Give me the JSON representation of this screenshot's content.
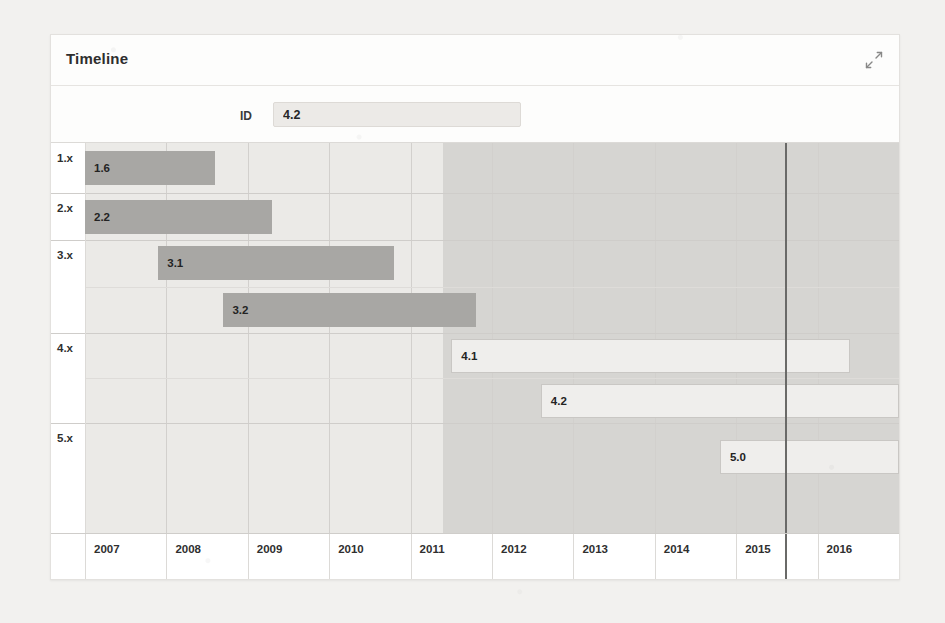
{
  "card": {
    "title": "Timeline",
    "expand_icon": "expand-arrows-icon"
  },
  "toolbar": {
    "id_label": "ID",
    "id_value": "4.2",
    "id_placeholder": ""
  },
  "chart_data": {
    "type": "gantt",
    "title": "Timeline",
    "xlabel": "",
    "ylabel": "",
    "grid": true,
    "legend": false,
    "x_axis": {
      "ticks": [
        "2007",
        "2008",
        "2009",
        "2010",
        "2011",
        "2012",
        "2013",
        "2014",
        "2015",
        "2016"
      ],
      "range": [
        2007,
        2017
      ]
    },
    "rows": [
      "1.x",
      "2.x",
      "3.x",
      "4.x",
      "5.x"
    ],
    "today_marker": 2015.6,
    "highlight_band": [
      2011.4,
      2017.0
    ],
    "tasks": [
      {
        "id": "1.6",
        "row": "1.x",
        "start": 2007.0,
        "end": 2008.6,
        "style": "dark"
      },
      {
        "id": "2.2",
        "row": "2.x",
        "start": 2007.0,
        "end": 2009.3,
        "style": "dark"
      },
      {
        "id": "3.1",
        "row": "3.x",
        "start": 2007.9,
        "end": 2010.8,
        "style": "dark"
      },
      {
        "id": "3.2",
        "row": "3.x",
        "start": 2008.7,
        "end": 2011.8,
        "style": "dark"
      },
      {
        "id": "4.1",
        "row": "4.x",
        "start": 2011.5,
        "end": 2016.4,
        "style": "light"
      },
      {
        "id": "4.2",
        "row": "4.x",
        "start": 2012.6,
        "end": 2017.0,
        "style": "light"
      },
      {
        "id": "5.0",
        "row": "5.x",
        "start": 2014.8,
        "end": 2017.0,
        "style": "light"
      }
    ]
  },
  "colors": {
    "bar_dark": "#a8a7a4",
    "bar_light": "#efeeec",
    "band": "#d6d5d2",
    "plot_bg": "#ebeae7",
    "today_line": "#6a6a68",
    "card_bg": "#fdfdfc",
    "page_bg": "#f2f1ef"
  }
}
